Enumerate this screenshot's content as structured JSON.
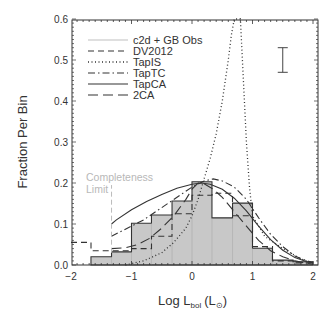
{
  "chart_data": {
    "type": "bar",
    "title": "",
    "xlabel": "Log L_bol (L_sun)",
    "xlabel_main": "Log L",
    "xlabel_sub": "bol",
    "xlabel_unit_open": "(L",
    "xlabel_unit_sub": "⊙",
    "xlabel_unit_close": ")",
    "ylabel": "Fraction Per Bin",
    "xlim": [
      -2,
      2.1
    ],
    "ylim": [
      0,
      0.6
    ],
    "x_ticks": [
      -2,
      -1,
      0,
      1,
      2
    ],
    "x_tick_labels": [
      "−2",
      "−1",
      "0",
      "1",
      "2"
    ],
    "y_ticks": [
      0.0,
      0.1,
      0.2,
      0.3,
      0.4,
      0.5,
      0.6
    ],
    "y_tick_labels": [
      "0.0",
      "0.1",
      "0.2",
      "0.3",
      "0.4",
      "0.5",
      "0.6"
    ],
    "grid": false,
    "legend_position": "upper left",
    "histogram": {
      "name": "c2d + GB Obs",
      "bin_edges": [
        -1.67,
        -1.33,
        -1.0,
        -0.67,
        -0.33,
        0.0,
        0.33,
        0.67,
        1.0,
        1.33,
        1.67,
        2.0
      ],
      "values": [
        0.02,
        0.032,
        0.102,
        0.122,
        0.156,
        0.203,
        0.115,
        0.151,
        0.041,
        0.012,
        0.008
      ],
      "fill": "#c8c8c8",
      "edge": "#333333"
    },
    "series": [
      {
        "name": "DV2012",
        "style": "dashed-step",
        "x": [
          -2.0,
          -1.67,
          -1.67,
          -1.33,
          -1.33,
          -1.0,
          -1.0,
          -0.67,
          -0.67,
          -0.33,
          -0.33,
          0.0,
          0.0,
          0.33,
          0.33,
          0.67,
          0.67,
          1.0,
          1.0,
          1.33,
          1.33,
          1.67,
          1.67,
          2.0
        ],
        "y": [
          0.055,
          0.055,
          0.035,
          0.035,
          0.035,
          0.035,
          0.04,
          0.04,
          0.07,
          0.07,
          0.125,
          0.125,
          0.17,
          0.17,
          0.175,
          0.175,
          0.12,
          0.12,
          0.045,
          0.045,
          0.01,
          0.01,
          0.005,
          0.005
        ]
      },
      {
        "name": "TapIS",
        "style": "dotted",
        "x": [
          -1.1,
          -0.8,
          -0.5,
          -0.3,
          -0.1,
          0.0,
          0.1,
          0.2,
          0.3,
          0.4,
          0.5,
          0.6,
          0.65,
          0.7,
          0.75,
          0.8,
          0.85,
          0.9,
          0.95,
          1.0,
          1.2,
          1.5,
          1.8,
          2.0
        ],
        "y": [
          0.0,
          0.01,
          0.03,
          0.055,
          0.09,
          0.12,
          0.16,
          0.21,
          0.26,
          0.32,
          0.4,
          0.5,
          0.56,
          0.63,
          0.66,
          0.6,
          0.45,
          0.3,
          0.19,
          0.12,
          0.07,
          0.04,
          0.015,
          0.005
        ]
      },
      {
        "name": "TapTC",
        "style": "dash-dot",
        "x": [
          -1.33,
          -1.2,
          -1.0,
          -0.8,
          -0.6,
          -0.4,
          -0.2,
          0.0,
          0.2,
          0.35,
          0.5,
          0.7,
          0.9,
          1.1,
          1.3,
          1.5,
          1.7,
          1.9,
          2.0
        ],
        "y": [
          0.07,
          0.08,
          0.095,
          0.11,
          0.13,
          0.15,
          0.17,
          0.19,
          0.205,
          0.21,
          0.205,
          0.19,
          0.16,
          0.115,
          0.075,
          0.045,
          0.022,
          0.01,
          0.006
        ]
      },
      {
        "name": "TapCA",
        "style": "solid",
        "x": [
          -1.33,
          -1.25,
          -1.0,
          -0.75,
          -0.5,
          -0.25,
          0.0,
          0.15,
          0.3,
          0.5,
          0.7,
          0.9,
          1.1,
          1.3,
          1.5,
          1.7,
          1.9,
          2.0
        ],
        "y": [
          0.1,
          0.11,
          0.135,
          0.155,
          0.172,
          0.187,
          0.197,
          0.2,
          0.197,
          0.185,
          0.163,
          0.132,
          0.095,
          0.062,
          0.036,
          0.018,
          0.008,
          0.005
        ]
      },
      {
        "name": "2CA",
        "style": "long-dash",
        "x": [
          -1.33,
          -1.1,
          -0.9,
          -0.7,
          -0.5,
          -0.3,
          -0.1,
          0.0,
          0.1,
          0.2,
          0.35,
          0.5,
          0.7,
          0.9,
          1.1,
          1.3,
          1.5,
          1.7,
          1.9,
          2.0
        ],
        "y": [
          0.04,
          0.042,
          0.05,
          0.065,
          0.09,
          0.12,
          0.16,
          0.185,
          0.2,
          0.198,
          0.185,
          0.165,
          0.13,
          0.095,
          0.06,
          0.035,
          0.02,
          0.01,
          0.004,
          0.002
        ]
      }
    ],
    "legend": [
      {
        "label": "c2d + GB Obs",
        "style": "solid-light"
      },
      {
        "label": "DV2012",
        "style": "dashed"
      },
      {
        "label": "TapIS",
        "style": "dotted"
      },
      {
        "label": "TapTC",
        "style": "dash-dot"
      },
      {
        "label": "TapCA",
        "style": "solid"
      },
      {
        "label": "2CA",
        "style": "long-dash"
      }
    ],
    "annotations": [
      {
        "text": "Completeness",
        "x": -1.45,
        "y": 0.21
      },
      {
        "text": "Limit",
        "x": -1.45,
        "y": 0.19
      },
      {
        "type": "vline",
        "x": -1.33,
        "y_range": [
          0.03,
          0.195
        ],
        "style": "dashed-light",
        "label": "completeness-limit"
      },
      {
        "type": "errorbar",
        "x": 1.5,
        "y_range": [
          0.47,
          0.53
        ],
        "label": "typical-error"
      }
    ]
  },
  "labels": {
    "ylabel": "Fraction Per Bin",
    "completeness_1": "Completeness",
    "completeness_2": "Limit"
  }
}
